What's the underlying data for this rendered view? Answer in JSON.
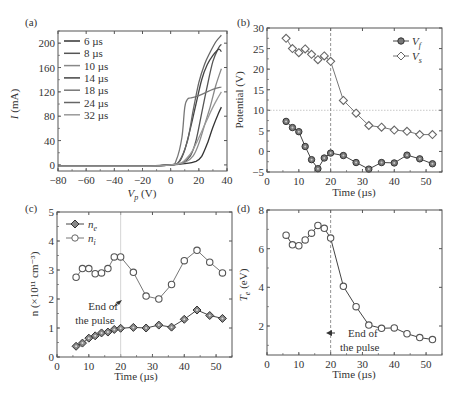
{
  "chart_data": [
    {
      "id": "a",
      "panel_label": "(a)",
      "type": "line",
      "xlabel": "V",
      "xlabel_sub": "p",
      "xlabel_unit": " (V)",
      "ylabel": "I",
      "ylabel_unit": " (mA)",
      "xlim": [
        -80,
        40
      ],
      "ylim": [
        -10,
        220
      ],
      "xticks": [
        -80,
        -60,
        -40,
        -20,
        0,
        20,
        40
      ],
      "xtick_labels": [
        "−80",
        "−60",
        "−40",
        "−20",
        "0",
        "20",
        "40"
      ],
      "yticks": [
        0,
        40,
        80,
        120,
        160,
        200
      ],
      "ytick_labels": [
        "0",
        "40",
        "80",
        "120",
        "160",
        "200"
      ],
      "legend_position": "top-left",
      "series": [
        {
          "name": "6 µs",
          "color": "#333333",
          "x": [
            -80,
            -20,
            0,
            10,
            18,
            22,
            26,
            30,
            34,
            36
          ],
          "y": [
            -2,
            -2,
            0,
            2,
            6,
            14,
            35,
            62,
            85,
            95
          ]
        },
        {
          "name": "8 µs",
          "color": "#555555",
          "x": [
            -80,
            -20,
            0,
            8,
            14,
            18,
            22,
            26,
            30,
            34,
            36
          ],
          "y": [
            -2,
            -2,
            0,
            3,
            15,
            40,
            85,
            130,
            170,
            192,
            198
          ]
        },
        {
          "name": "10 µs",
          "color": "#888888",
          "x": [
            -80,
            -20,
            0,
            10,
            16,
            20,
            24,
            28,
            32,
            36
          ],
          "y": [
            -2,
            -2,
            0,
            4,
            15,
            35,
            65,
            95,
            130,
            158
          ]
        },
        {
          "name": "14 µs",
          "color": "#444444",
          "x": [
            -80,
            -20,
            0,
            6,
            10,
            14,
            18,
            22,
            26,
            30,
            34,
            36
          ],
          "y": [
            -2,
            -2,
            0,
            5,
            25,
            60,
            100,
            140,
            165,
            180,
            190,
            186
          ]
        },
        {
          "name": "18 µs",
          "color": "#777777",
          "x": [
            -80,
            -20,
            0,
            4,
            8,
            10,
            12,
            14,
            18,
            24,
            30,
            36
          ],
          "y": [
            -2,
            -2,
            0,
            8,
            45,
            95,
            108,
            110,
            112,
            118,
            124,
            128
          ]
        },
        {
          "name": "24 µs",
          "color": "#666666",
          "x": [
            -80,
            -20,
            0,
            6,
            12,
            16,
            20,
            24,
            28,
            32,
            36
          ],
          "y": [
            -2,
            -2,
            0,
            6,
            40,
            90,
            135,
            165,
            185,
            202,
            213
          ]
        },
        {
          "name": "32 µs",
          "color": "#999999",
          "x": [
            -80,
            -20,
            0,
            8,
            14,
            18,
            22,
            26,
            30,
            34,
            36
          ],
          "y": [
            -2,
            -2,
            0,
            4,
            18,
            35,
            55,
            75,
            95,
            112,
            120
          ]
        }
      ]
    },
    {
      "id": "b",
      "panel_label": "(b)",
      "type": "line",
      "xlabel": "Time (µs)",
      "ylabel": "Potential (V)",
      "xlim": [
        0,
        55
      ],
      "ylim": [
        -5,
        30
      ],
      "xticks": [
        0,
        10,
        20,
        30,
        40,
        50
      ],
      "xtick_labels": [
        "0",
        "10",
        "20",
        "30",
        "40",
        "50"
      ],
      "yticks": [
        -5,
        0,
        5,
        10,
        15,
        20,
        25,
        30
      ],
      "ytick_labels": [
        "−5",
        "0",
        "5",
        "10",
        "15",
        "20",
        "25",
        "30"
      ],
      "vline_x": 20,
      "hline_y": 10,
      "legend_position": "top-right",
      "series": [
        {
          "name": "V",
          "sub": "f",
          "marker": "circle-filled",
          "x": [
            6,
            8,
            10,
            12,
            14,
            16,
            18,
            20,
            24,
            28,
            32,
            36,
            40,
            44,
            48,
            52
          ],
          "y": [
            7.3,
            5.8,
            4.8,
            1.2,
            -2.0,
            -4.2,
            -1.6,
            -0.4,
            -1.0,
            -2.7,
            -4.3,
            -2.7,
            -2.8,
            -0.9,
            -1.8,
            -3.0
          ]
        },
        {
          "name": "V",
          "sub": "s",
          "marker": "diamond-open",
          "x": [
            6,
            8,
            10,
            12,
            14,
            16,
            18,
            20,
            24,
            28,
            32,
            36,
            40,
            44,
            48,
            52
          ],
          "y": [
            27.5,
            25.0,
            24.0,
            24.9,
            23.6,
            22.3,
            23.2,
            21.9,
            12.4,
            9.3,
            6.3,
            5.9,
            5.2,
            4.9,
            4.1,
            4.1
          ]
        }
      ]
    },
    {
      "id": "c",
      "panel_label": "(c)",
      "type": "line",
      "xlabel": "Time (µs)",
      "ylabel": "n (×10¹¹ cm⁻³)",
      "xlim": [
        0,
        55
      ],
      "ylim": [
        0,
        5
      ],
      "xticks": [
        0,
        10,
        20,
        30,
        40,
        50
      ],
      "xtick_labels": [
        "0",
        "10",
        "20",
        "30",
        "40",
        "50"
      ],
      "yticks": [
        0,
        1,
        2,
        3,
        4,
        5
      ],
      "ytick_labels": [
        "0",
        "1",
        "2",
        "3",
        "4",
        "5"
      ],
      "vline_x": 20,
      "annotation": [
        "End of",
        "the pulse"
      ],
      "legend_position": "top-left",
      "series": [
        {
          "name": "n",
          "sub": "e",
          "marker": "diamond-filled",
          "x": [
            6,
            8,
            10,
            12,
            14,
            16,
            18,
            20,
            24,
            28,
            32,
            36,
            40,
            44,
            48,
            52
          ],
          "y": [
            0.37,
            0.48,
            0.65,
            0.73,
            0.83,
            0.86,
            0.95,
            0.99,
            1.02,
            1.0,
            1.1,
            1.03,
            1.3,
            1.62,
            1.43,
            1.33
          ]
        },
        {
          "name": "n",
          "sub": "i",
          "marker": "circle-open",
          "x": [
            6,
            8,
            10,
            12,
            14,
            16,
            18,
            20,
            24,
            28,
            32,
            36,
            40,
            44,
            48,
            52
          ],
          "y": [
            2.75,
            3.05,
            3.05,
            2.87,
            2.9,
            3.05,
            3.45,
            3.45,
            2.92,
            2.1,
            2.0,
            2.5,
            3.32,
            3.68,
            3.27,
            2.9
          ]
        }
      ]
    },
    {
      "id": "d",
      "panel_label": "(d)",
      "type": "line",
      "xlabel": "Time (µs)",
      "ylabel": "T",
      "ylabel_sub": "e",
      "ylabel_unit": " (eV)",
      "xlim": [
        0,
        55
      ],
      "ylim": [
        0.5,
        8
      ],
      "xticks": [
        0,
        10,
        20,
        30,
        40,
        50
      ],
      "xtick_labels": [
        "0",
        "10",
        "20",
        "30",
        "40",
        "50"
      ],
      "yticks": [
        2,
        4,
        6,
        8
      ],
      "ytick_labels": [
        "2",
        "4",
        "6",
        "8"
      ],
      "vline_x": 20,
      "annotation": [
        "End of",
        "the pulse"
      ],
      "series": [
        {
          "name": "Te",
          "marker": "circle-open",
          "x": [
            6,
            8,
            10,
            12,
            14,
            16,
            18,
            20,
            24,
            28,
            32,
            36,
            40,
            44,
            48,
            52
          ],
          "y": [
            6.7,
            6.2,
            6.15,
            6.45,
            6.8,
            7.2,
            7.05,
            6.55,
            4.05,
            3.0,
            2.05,
            1.88,
            1.9,
            1.6,
            1.4,
            1.3
          ]
        }
      ]
    }
  ]
}
